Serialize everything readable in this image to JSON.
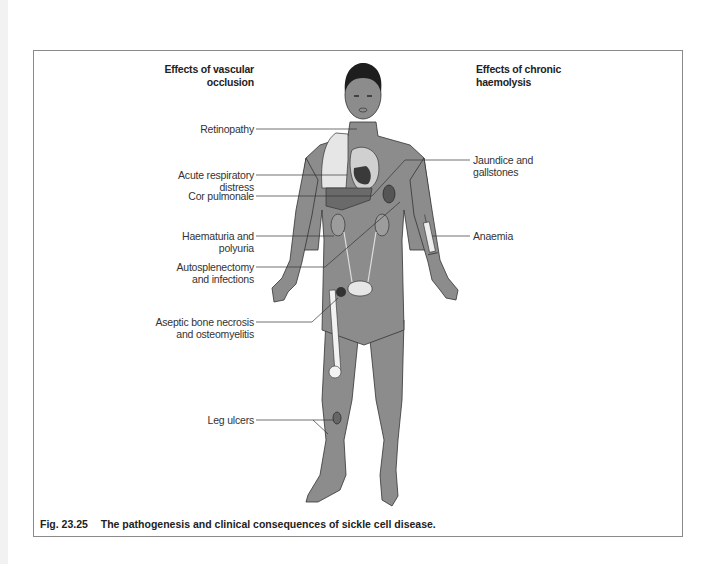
{
  "figure": {
    "left_heading": "Effects of vascular occlusion",
    "left_heading_lines": [
      "Effects of vascular",
      "occlusion"
    ],
    "right_heading_lines": [
      "Effects of chronic",
      "haemolysis"
    ],
    "left_labels": [
      {
        "lines": [
          "Retinopathy"
        ]
      },
      {
        "lines": [
          "Acute respiratory",
          "distress"
        ]
      },
      {
        "lines": [
          "Cor pulmonale"
        ]
      },
      {
        "lines": [
          "Haematuria and",
          "polyuria"
        ]
      },
      {
        "lines": [
          "Autosplenectomy",
          "and infections"
        ]
      },
      {
        "lines": [
          "Aseptic bone necrosis",
          "and osteomyelitis"
        ]
      },
      {
        "lines": [
          "Leg ulcers"
        ]
      }
    ],
    "right_labels": [
      {
        "lines": [
          "Jaundice and",
          "gallstones"
        ]
      },
      {
        "lines": [
          "Anaemia"
        ]
      }
    ],
    "caption": {
      "number": "Fig. 23.25",
      "text": "The pathogenesis and clinical consequences of sickle cell disease."
    },
    "colors": {
      "skin": "#8c8c8c",
      "hair": "#1e1e1e",
      "lung": "#e6e6e6",
      "organ_dark": "#3a3a3a",
      "leader_line": "#333333",
      "frame_border": "#8a8a8a"
    }
  }
}
